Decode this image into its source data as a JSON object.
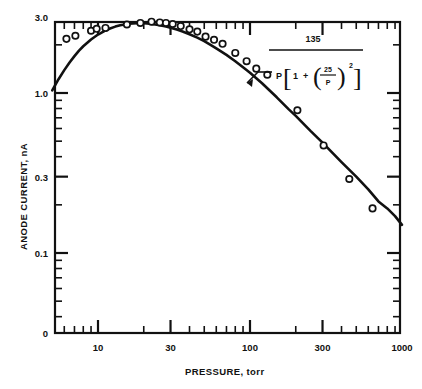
{
  "chart_data": {
    "type": "line",
    "title": "",
    "xlabel": "PRESSURE, torr",
    "ylabel": "ANODE CURRENT, nA",
    "xscale": "log",
    "yscale": "log",
    "xlim": [
      5,
      1000
    ],
    "ylim": [
      0.05,
      3.0
    ],
    "grid": false,
    "legend": null,
    "xticklabels": [
      "10",
      "30",
      "100",
      "300",
      "1000"
    ],
    "xtickvalues": [
      10,
      30,
      100,
      300,
      1000
    ],
    "yticklabels": [
      "3.0",
      "1.0",
      "0.3",
      "0.1",
      "0"
    ],
    "ytickvalues": [
      3.0,
      1.0,
      0.3,
      0.1,
      0
    ],
    "annotation": {
      "numerator": "135",
      "denom_lead": "P",
      "denom_one": "1",
      "denom_plus": "+",
      "denom_frac_num": "25",
      "denom_frac_den": "P",
      "denom_exp": "2",
      "bracket_open": "[",
      "bracket_close": "]",
      "paren_open": "(",
      "paren_close": ")",
      "pointer": "leader-arrow-to-curve"
    },
    "series": [
      {
        "name": "fitted curve",
        "kind": "curve",
        "x": [
          5,
          5.5,
          6,
          6.5,
          7,
          7.5,
          8,
          9,
          10,
          11,
          12,
          13,
          14,
          15,
          16,
          18,
          20,
          22,
          25,
          28,
          30,
          33,
          36,
          40,
          45,
          50,
          55,
          60,
          70,
          80,
          90,
          100,
          120,
          150,
          180,
          200,
          250,
          300,
          400,
          500,
          600,
          700,
          800,
          900,
          1000
        ],
        "y": [
          1.04,
          1.22,
          1.39,
          1.55,
          1.7,
          1.84,
          1.96,
          2.16,
          2.32,
          2.44,
          2.53,
          2.6,
          2.65,
          2.68,
          2.71,
          2.73,
          2.73,
          2.71,
          2.66,
          2.6,
          2.56,
          2.49,
          2.42,
          2.33,
          2.22,
          2.11,
          2.0,
          1.9,
          1.73,
          1.58,
          1.45,
          1.34,
          1.15,
          0.94,
          0.79,
          0.72,
          0.58,
          0.49,
          0.37,
          0.3,
          0.25,
          0.21,
          0.19,
          0.17,
          0.15
        ]
      },
      {
        "name": "measured data",
        "kind": "points",
        "x": [
          6.2,
          7.1,
          9.0,
          9.8,
          11.2,
          15.5,
          19.0,
          22.5,
          25.5,
          28.0,
          31.0,
          35.0,
          40.0,
          45.0,
          51.0,
          58.0,
          66.0,
          80.0,
          95.0,
          110.0,
          130.0,
          205.0,
          305.0,
          450.0,
          640.0
        ],
        "y": [
          2.18,
          2.28,
          2.45,
          2.52,
          2.55,
          2.68,
          2.74,
          2.79,
          2.76,
          2.74,
          2.7,
          2.62,
          2.5,
          2.42,
          2.25,
          2.15,
          2.03,
          1.78,
          1.58,
          1.42,
          1.3,
          0.78,
          0.47,
          0.29,
          0.19
        ]
      }
    ]
  },
  "axes_geometry": {
    "left_px": 55,
    "right_px": 400,
    "top_px": 22,
    "bottom_px": 333,
    "x_decade_px": 152.0,
    "x_ref_value": 10,
    "x_ref_px": 98,
    "y_decade_px": 160.0,
    "y_ref_value": 1.0,
    "y_ref_px": 93
  },
  "colors": {
    "ink": "#111111",
    "background": "#ffffff",
    "marker_fill": "#ffffff"
  }
}
